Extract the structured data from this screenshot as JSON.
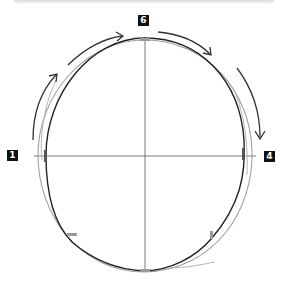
{
  "figure": {
    "type": "head-outline-construction",
    "labels": [
      {
        "id": "label-6",
        "text": "6"
      },
      {
        "id": "label-1",
        "text": "1"
      },
      {
        "id": "label-4",
        "text": "4"
      }
    ],
    "colors": {
      "line_dark": "#222222",
      "line_light": "#9a9a9a",
      "guide": "#555555",
      "marker": "#888888",
      "label_bg": "#111111",
      "label_fg": "#ffffff"
    },
    "arrows": [
      {
        "name": "arrow-left-upward",
        "direction": "up"
      },
      {
        "name": "arrow-top-left",
        "direction": "right"
      },
      {
        "name": "arrow-top-right",
        "direction": "right"
      },
      {
        "name": "arrow-right-downward",
        "direction": "down"
      }
    ]
  }
}
